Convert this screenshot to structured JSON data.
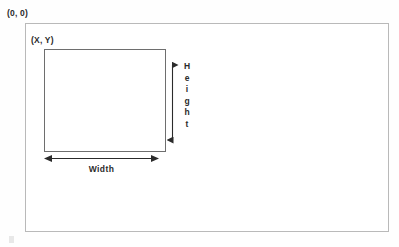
{
  "diagram": {
    "origin_label": "(0, 0)",
    "position_label": "(X, Y)",
    "width_label": "Width",
    "height_label": "Height",
    "height_letters": [
      "H",
      "e",
      "i",
      "g",
      "h",
      "t"
    ],
    "colors": {
      "background": "#fefefe",
      "outer_border": "#b9b9b9",
      "inner_border": "#6e6e6e",
      "text": "#2b2b2b",
      "arrow": "#2b2b2b"
    },
    "geometry": {
      "outer_rect": {
        "x": 25,
        "y": 23,
        "width": 364,
        "height": 209
      },
      "inner_rect": {
        "x": 44,
        "y": 49,
        "width": 122,
        "height": 103
      },
      "height_arrow": {
        "x": 172,
        "y_start": 60,
        "y_end": 145
      },
      "width_arrow": {
        "y": 158,
        "x_start": 46,
        "x_end": 157
      }
    }
  }
}
